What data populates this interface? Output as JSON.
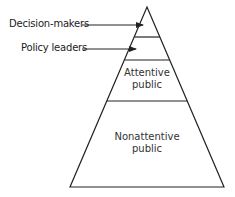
{
  "diagram": {
    "type": "pyramid",
    "labels": {
      "decision_makers": "Decision-makers",
      "policy_leaders": "Policy leaders"
    },
    "tiers": {
      "attentive_line1": "Attentive",
      "attentive_line2": "public",
      "nonattentive_line1": "Nonattentive",
      "nonattentive_line2": "public"
    },
    "colors": {
      "stroke": "#222222",
      "background": "#ffffff"
    }
  }
}
